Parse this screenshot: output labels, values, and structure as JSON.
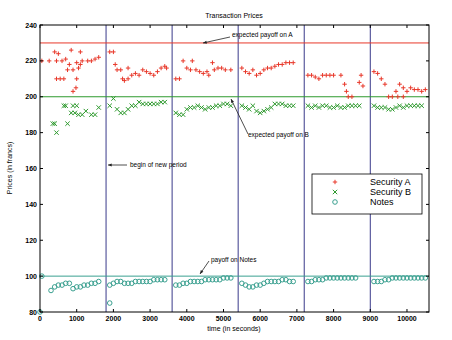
{
  "chart_data": {
    "type": "scatter",
    "title": "Transaction Prices",
    "xlabel": "time (in seconds)",
    "ylabel": "Prices (in francs)",
    "xlim": [
      0,
      10600
    ],
    "ylim": [
      80,
      240
    ],
    "xticks": [
      0,
      1000,
      2000,
      3000,
      4000,
      5000,
      6000,
      7000,
      8000,
      9000,
      10000
    ],
    "yticks": [
      80,
      100,
      120,
      140,
      160,
      180,
      200,
      220,
      240
    ],
    "grid": false,
    "legend_position": "center-right",
    "period_boundaries": [
      1800,
      3600,
      5400,
      7200,
      9000
    ],
    "reference_lines": [
      {
        "name": "expected payoff on A",
        "y": 230,
        "color": "#e8382a"
      },
      {
        "name": "expected payoff on B",
        "y": 200,
        "color": "#2e9a2e"
      },
      {
        "name": "payoff on Notes",
        "y": 100,
        "color": "#3aa090"
      }
    ],
    "annotations": [
      {
        "text": "expected payoff on A",
        "x": 5900,
        "y": 232
      },
      {
        "text": "expected payoff on B",
        "x": 5700,
        "y": 184
      },
      {
        "text": "begin of new period",
        "x": 2100,
        "y": 156
      },
      {
        "text": "payoff on Notes",
        "x": 4700,
        "y": 103
      }
    ],
    "series": [
      {
        "name": "Security A",
        "marker": "+",
        "color": "#e8382a",
        "points": [
          [
            50,
            220
          ],
          [
            250,
            220
          ],
          [
            450,
            220
          ],
          [
            600,
            220
          ],
          [
            700,
            221
          ],
          [
            400,
            225
          ],
          [
            850,
            226
          ],
          [
            1100,
            225
          ],
          [
            500,
            224
          ],
          [
            450,
            210
          ],
          [
            550,
            210
          ],
          [
            650,
            210
          ],
          [
            750,
            215
          ],
          [
            900,
            215
          ],
          [
            1050,
            216
          ],
          [
            1000,
            210
          ],
          [
            980,
            205
          ],
          [
            900,
            203
          ],
          [
            1150,
            220
          ],
          [
            1300,
            220
          ],
          [
            1400,
            220
          ],
          [
            1500,
            221
          ],
          [
            1600,
            222
          ],
          [
            1000,
            219
          ],
          [
            1100,
            218
          ],
          [
            800,
            218
          ],
          [
            1900,
            225
          ],
          [
            2000,
            225
          ],
          [
            2100,
            215
          ],
          [
            2200,
            215
          ],
          [
            2250,
            210
          ],
          [
            2300,
            209
          ],
          [
            2400,
            210
          ],
          [
            2500,
            212
          ],
          [
            2600,
            213
          ],
          [
            2700,
            212
          ],
          [
            2800,
            215
          ],
          [
            2900,
            214
          ],
          [
            3000,
            213
          ],
          [
            3100,
            212
          ],
          [
            3200,
            214
          ],
          [
            3300,
            216
          ],
          [
            3400,
            217
          ],
          [
            3450,
            216
          ],
          [
            2050,
            218
          ],
          [
            2400,
            216
          ],
          [
            3700,
            210
          ],
          [
            3800,
            210
          ],
          [
            3900,
            220
          ],
          [
            4000,
            216
          ],
          [
            4100,
            215
          ],
          [
            4150,
            220
          ],
          [
            4250,
            215
          ],
          [
            4350,
            214
          ],
          [
            4450,
            213
          ],
          [
            4550,
            214
          ],
          [
            4600,
            212
          ],
          [
            4700,
            219
          ],
          [
            4750,
            215
          ],
          [
            4850,
            216
          ],
          [
            4950,
            216
          ],
          [
            5050,
            215
          ],
          [
            5200,
            215
          ],
          [
            5500,
            216
          ],
          [
            5600,
            214
          ],
          [
            5700,
            213
          ],
          [
            5800,
            215
          ],
          [
            5900,
            212
          ],
          [
            6000,
            213
          ],
          [
            6100,
            215
          ],
          [
            6200,
            216
          ],
          [
            6300,
            216
          ],
          [
            6400,
            217
          ],
          [
            6500,
            218
          ],
          [
            6600,
            218
          ],
          [
            6700,
            219
          ],
          [
            6800,
            219
          ],
          [
            6900,
            219
          ],
          [
            7300,
            212
          ],
          [
            7400,
            212
          ],
          [
            7500,
            211
          ],
          [
            7600,
            210
          ],
          [
            7700,
            212
          ],
          [
            7800,
            212
          ],
          [
            7900,
            212
          ],
          [
            8000,
            212
          ],
          [
            8200,
            212
          ],
          [
            8300,
            207
          ],
          [
            8350,
            203
          ],
          [
            8400,
            200
          ],
          [
            8500,
            200
          ],
          [
            8700,
            208
          ],
          [
            8750,
            212
          ],
          [
            8800,
            206
          ],
          [
            9100,
            214
          ],
          [
            9200,
            213
          ],
          [
            9300,
            210
          ],
          [
            9400,
            207
          ],
          [
            9500,
            200
          ],
          [
            9600,
            200
          ],
          [
            9700,
            203
          ],
          [
            9800,
            207
          ],
          [
            9900,
            205
          ],
          [
            10000,
            203
          ],
          [
            10100,
            205
          ],
          [
            10200,
            204
          ],
          [
            10300,
            204
          ],
          [
            10400,
            203
          ],
          [
            10500,
            204
          ],
          [
            9750,
            200
          ],
          [
            9900,
            200
          ]
        ]
      },
      {
        "name": "Security B",
        "marker": "x",
        "color": "#2e9a2e",
        "points": [
          [
            350,
            185
          ],
          [
            450,
            180
          ],
          [
            400,
            185
          ],
          [
            750,
            185
          ],
          [
            650,
            195
          ],
          [
            700,
            195
          ],
          [
            900,
            195
          ],
          [
            1000,
            195
          ],
          [
            850,
            191
          ],
          [
            950,
            191
          ],
          [
            1050,
            190
          ],
          [
            1150,
            190
          ],
          [
            1250,
            192
          ],
          [
            1400,
            190
          ],
          [
            1500,
            190
          ],
          [
            1600,
            194
          ],
          [
            1900,
            195
          ],
          [
            2000,
            199
          ],
          [
            2100,
            193
          ],
          [
            2200,
            191
          ],
          [
            2300,
            191
          ],
          [
            2400,
            193
          ],
          [
            2500,
            195
          ],
          [
            2600,
            195
          ],
          [
            2700,
            197
          ],
          [
            2800,
            196
          ],
          [
            2900,
            196
          ],
          [
            3000,
            196
          ],
          [
            3100,
            196
          ],
          [
            3200,
            196
          ],
          [
            3300,
            197
          ],
          [
            3400,
            197
          ],
          [
            3700,
            191
          ],
          [
            3800,
            190
          ],
          [
            3900,
            190
          ],
          [
            4000,
            193
          ],
          [
            4100,
            194
          ],
          [
            4200,
            194
          ],
          [
            4300,
            195
          ],
          [
            4400,
            194
          ],
          [
            4500,
            193
          ],
          [
            4600,
            194
          ],
          [
            4700,
            194
          ],
          [
            4800,
            195
          ],
          [
            4900,
            195
          ],
          [
            5000,
            196
          ],
          [
            5100,
            196
          ],
          [
            5200,
            195
          ],
          [
            5500,
            195
          ],
          [
            5600,
            194
          ],
          [
            5700,
            193
          ],
          [
            5800,
            195
          ],
          [
            5900,
            192
          ],
          [
            6000,
            191
          ],
          [
            6100,
            192
          ],
          [
            6200,
            193
          ],
          [
            6300,
            194
          ],
          [
            6400,
            196
          ],
          [
            6500,
            196
          ],
          [
            6600,
            196
          ],
          [
            6700,
            195
          ],
          [
            6800,
            195
          ],
          [
            6900,
            195
          ],
          [
            7300,
            195
          ],
          [
            7400,
            194
          ],
          [
            7500,
            195
          ],
          [
            7600,
            194
          ],
          [
            7700,
            195
          ],
          [
            7800,
            195
          ],
          [
            7900,
            194
          ],
          [
            8000,
            194
          ],
          [
            8100,
            195
          ],
          [
            8200,
            194
          ],
          [
            8300,
            194
          ],
          [
            8400,
            195
          ],
          [
            8500,
            195
          ],
          [
            8600,
            195
          ],
          [
            8700,
            195
          ],
          [
            9100,
            195
          ],
          [
            9200,
            194
          ],
          [
            9300,
            194
          ],
          [
            9400,
            194
          ],
          [
            9500,
            193
          ],
          [
            9600,
            193
          ],
          [
            9700,
            194
          ],
          [
            9800,
            195
          ],
          [
            9900,
            194
          ],
          [
            10000,
            195
          ],
          [
            10100,
            195
          ],
          [
            10200,
            195
          ],
          [
            10300,
            195
          ],
          [
            10400,
            195
          ]
        ]
      },
      {
        "name": "Notes",
        "marker": "o",
        "color": "#3aa090",
        "points": [
          [
            50,
            100
          ],
          [
            0,
            80
          ],
          [
            300,
            92
          ],
          [
            400,
            94
          ],
          [
            500,
            95
          ],
          [
            600,
            95
          ],
          [
            700,
            96
          ],
          [
            800,
            96
          ],
          [
            900,
            93
          ],
          [
            1000,
            94
          ],
          [
            1100,
            94
          ],
          [
            1200,
            95
          ],
          [
            1300,
            95
          ],
          [
            1400,
            96
          ],
          [
            1500,
            96
          ],
          [
            1600,
            97
          ],
          [
            1900,
            85
          ],
          [
            1900,
            95
          ],
          [
            2000,
            96
          ],
          [
            2100,
            97
          ],
          [
            2200,
            97
          ],
          [
            2300,
            96
          ],
          [
            2400,
            96
          ],
          [
            2500,
            96
          ],
          [
            2600,
            97
          ],
          [
            2700,
            97
          ],
          [
            2800,
            97
          ],
          [
            2900,
            97
          ],
          [
            3000,
            97
          ],
          [
            3100,
            98
          ],
          [
            3200,
            98
          ],
          [
            3300,
            98
          ],
          [
            3400,
            98
          ],
          [
            3700,
            95
          ],
          [
            3800,
            95
          ],
          [
            3900,
            96
          ],
          [
            4000,
            96
          ],
          [
            4100,
            97
          ],
          [
            4200,
            97
          ],
          [
            4300,
            97
          ],
          [
            4400,
            97
          ],
          [
            4500,
            98
          ],
          [
            4600,
            98
          ],
          [
            4700,
            98
          ],
          [
            4800,
            98
          ],
          [
            4900,
            98
          ],
          [
            5000,
            99
          ],
          [
            5100,
            99
          ],
          [
            5200,
            99
          ],
          [
            5500,
            96
          ],
          [
            5600,
            95
          ],
          [
            5700,
            94
          ],
          [
            5800,
            94
          ],
          [
            5900,
            95
          ],
          [
            6000,
            95
          ],
          [
            6100,
            96
          ],
          [
            6200,
            97
          ],
          [
            6300,
            97
          ],
          [
            6400,
            97
          ],
          [
            6500,
            97
          ],
          [
            6600,
            98
          ],
          [
            6700,
            98
          ],
          [
            6800,
            97
          ],
          [
            6900,
            97
          ],
          [
            7300,
            97
          ],
          [
            7400,
            97
          ],
          [
            7500,
            98
          ],
          [
            7600,
            98
          ],
          [
            7700,
            98
          ],
          [
            7800,
            99
          ],
          [
            7900,
            99
          ],
          [
            8000,
            99
          ],
          [
            8100,
            99
          ],
          [
            8200,
            99
          ],
          [
            8300,
            99
          ],
          [
            8400,
            99
          ],
          [
            8500,
            99
          ],
          [
            8600,
            99
          ],
          [
            9100,
            97
          ],
          [
            9200,
            97
          ],
          [
            9300,
            97
          ],
          [
            9400,
            98
          ],
          [
            9500,
            98
          ],
          [
            9600,
            99
          ],
          [
            9700,
            99
          ],
          [
            9800,
            99
          ],
          [
            9900,
            99
          ],
          [
            10000,
            99
          ],
          [
            10100,
            99
          ],
          [
            10200,
            99
          ],
          [
            10300,
            99
          ],
          [
            10400,
            99
          ],
          [
            10500,
            99
          ]
        ]
      }
    ]
  },
  "legend": {
    "items": [
      {
        "label": "Security A",
        "marker": "+",
        "color": "#e8382a"
      },
      {
        "label": "Security B",
        "marker": "x",
        "color": "#2e9a2e"
      },
      {
        "label": "Notes",
        "marker": "o",
        "color": "#3aa090"
      }
    ]
  }
}
